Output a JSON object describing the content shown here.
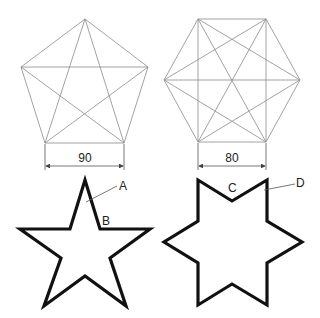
{
  "figures": {
    "pentagon": {
      "dimension_label": "90",
      "shape": "regular pentagon with all diagonals (pentagram)"
    },
    "hexagon": {
      "dimension_label": "80",
      "shape": "regular hexagon with all diagonals"
    },
    "pentagram": {
      "labels": {
        "a": "A",
        "b": "B"
      },
      "shape": "five-pointed star outline"
    },
    "hexagram": {
      "labels": {
        "c": "C",
        "d": "D"
      },
      "shape": "six-pointed star outline"
    }
  },
  "colors": {
    "construction_line": "#8a8a8a",
    "outline": "#111111"
  }
}
